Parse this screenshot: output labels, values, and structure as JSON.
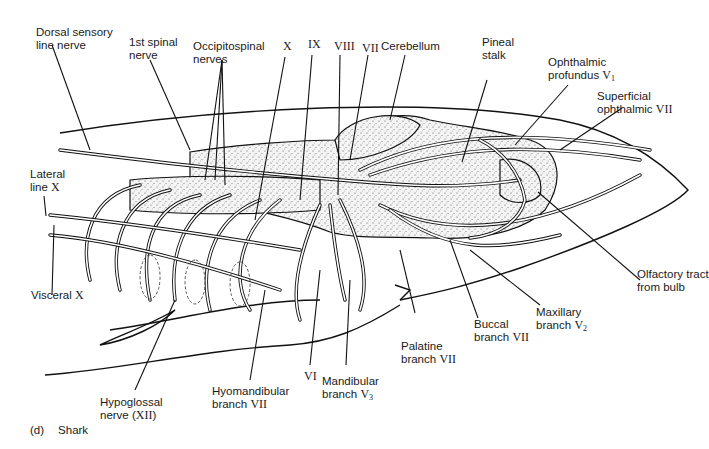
{
  "figure": {
    "caption_letter": "(d)",
    "caption_text": "Shark"
  },
  "labels": {
    "dorsal_sensory": {
      "text": "Dorsal sensory",
      "text2": "line nerve"
    },
    "first_spinal": {
      "text": "1st spinal",
      "text2": "nerve"
    },
    "occipitospinal": {
      "text": "Occipitospinal",
      "text2": "nerves"
    },
    "x_top": {
      "roman": "X"
    },
    "ix": {
      "roman": "IX"
    },
    "viii": {
      "roman": "VIII"
    },
    "vii_top": {
      "roman": "VII"
    },
    "cerebellum": {
      "text": "Cerebellum"
    },
    "pineal": {
      "text": "Pineal",
      "text2": "stalk"
    },
    "ophthalmic_profundus": {
      "text": "Ophthalmic",
      "text2": "profundus",
      "roman": "V",
      "sub": "1"
    },
    "superficial_ophthalmic": {
      "text": "Superficial",
      "text2": "ophthalmic",
      "roman": "VII"
    },
    "lateral_line": {
      "text": "Lateral",
      "text2": "line",
      "roman": "X"
    },
    "visceral": {
      "text": "Visceral",
      "roman": "X"
    },
    "olfactory": {
      "text": "Olfactory tract",
      "text2": "from bulb"
    },
    "maxillary": {
      "text": "Maxillary",
      "text2": "branch",
      "roman": "V",
      "sub": "2"
    },
    "buccal": {
      "text": "Buccal",
      "text2": "branch",
      "roman": "VII"
    },
    "palatine": {
      "text": "Palatine",
      "text2": "branch",
      "roman": "VII"
    },
    "mandibular": {
      "text": "Mandibular",
      "text2": "branch",
      "roman": "V",
      "sub": "3"
    },
    "vi": {
      "roman": "VI"
    },
    "hyomandibular": {
      "text": "Hyomandibular",
      "text2": "branch",
      "roman": "VII"
    },
    "hypoglossal": {
      "text": "Hypoglossal",
      "text2": "nerve (",
      "roman": "XII",
      "text3": ")"
    }
  },
  "colors": {
    "ink": "#111111",
    "background": "#ffffff"
  }
}
